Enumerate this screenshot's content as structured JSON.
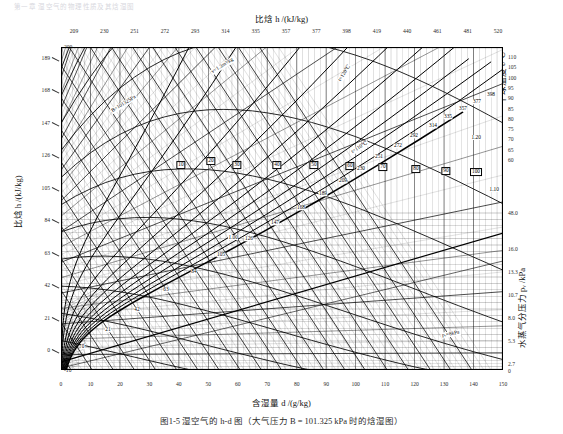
{
  "topnote": "第一章  湿空气的物理性质及其焓湿图",
  "titles": {
    "top": "比焓 h /(kJ/kg)",
    "bottom": "含湿量 d /(g/kg)",
    "left": "比焓 h /(kJ/kg)",
    "right_temp": "干球温度 t/℃",
    "right_pv": "水蒸气分压力 pᵥ /kPa"
  },
  "caption": "图1-5   湿空气的 h-d 图（大气压力 B = 101.325 kPa 时的焓湿图）",
  "axes": {
    "x_label_values": [
      0,
      10,
      20,
      30,
      40,
      50,
      60,
      70,
      80,
      90,
      100,
      110,
      120,
      130,
      140,
      150
    ],
    "x_range": [
      0,
      150
    ],
    "top_enthalpy_ticks": [
      209,
      230,
      251,
      272,
      293,
      314,
      335,
      357,
      377,
      398,
      419,
      440,
      461,
      481,
      520
    ],
    "left_enthalpy_ticks": [
      189,
      168,
      147,
      126,
      105,
      84,
      63,
      42,
      21,
      0
    ],
    "left_temperature_ticks": [
      200,
      190,
      180,
      170,
      160,
      150,
      140,
      130,
      120,
      110,
      100,
      90,
      80,
      70,
      60,
      50,
      40,
      30,
      20,
      10,
      0,
      -10
    ],
    "t_range": [
      -10,
      200
    ],
    "right_temperature_ticks": [
      110,
      105,
      100,
      95,
      90,
      85,
      80,
      75,
      70,
      65,
      60
    ],
    "right_pv_ticks": [
      "48.0",
      "16.0",
      "13.3",
      "10.7",
      "8.0",
      "5.3",
      "2.7",
      "0"
    ]
  },
  "chart_data": {
    "type": "line",
    "xlabel": "含湿量 d /(g/kg)",
    "ylabel": "比焓 h /(kJ/kg)",
    "xlim": [
      0,
      150
    ],
    "ylim": [
      -10,
      200
    ],
    "grid": true,
    "legend": "inline",
    "barometric_pressure_label": "B=101325 Pa",
    "series": [
      {
        "name": "dry-bulb-temperature-isotherms",
        "unit": "℃",
        "values": [
          -10,
          0,
          10,
          20,
          30,
          40,
          50,
          60,
          70,
          80,
          90,
          100,
          110,
          120,
          130,
          140,
          150,
          160,
          170,
          180,
          190,
          200
        ],
        "labels": [
          "t=120℃",
          "t=110℃"
        ]
      },
      {
        "name": "relative-humidity-curves",
        "unit": "%",
        "values": [
          5,
          10,
          20,
          30,
          40,
          50,
          60,
          70,
          80,
          90,
          100
        ],
        "labeled": [
          10,
          20,
          30,
          40,
          50,
          60,
          70,
          80,
          90,
          100
        ]
      },
      {
        "name": "specific-volume-lines",
        "unit": "m³/kg",
        "values": [
          0.8,
          0.85,
          0.9,
          0.95,
          1.0,
          1.05,
          1.1,
          1.15,
          1.2,
          1.25,
          1.3
        ],
        "labels": [
          "v=1.3m³/kg",
          "1.20",
          "1.10",
          "1.00"
        ]
      },
      {
        "name": "enthalpy-isolines",
        "unit": "kJ/kg",
        "values": [
          0,
          21,
          42,
          63,
          84,
          105,
          126,
          147,
          168,
          189,
          209,
          230,
          251,
          272,
          292,
          314,
          335,
          357,
          377,
          398
        ]
      },
      {
        "name": "vapour-pressure-scale",
        "unit": "kPa",
        "values": [
          0,
          2.7,
          5.3,
          8.0,
          10.7,
          13.3,
          16.0,
          48.0
        ],
        "labels": [
          "pᵥ=8kPa"
        ]
      }
    ]
  },
  "inline_labels": {
    "v13": "v=1.3m³/kg",
    "v120": "1.20",
    "v110": "1.10",
    "v100": "1.00",
    "t120": "t=120℃",
    "t110": "t=110℃",
    "barometric": "B=101325Pa",
    "pv8": "pᵥ=8kPa"
  },
  "enthalpy_inline": [
    "0",
    "21",
    "42",
    "63",
    "84",
    "105",
    "126",
    "147",
    "168",
    "189",
    "209",
    "230",
    "251",
    "272",
    "292",
    "314",
    "335",
    "357",
    "377",
    "398"
  ],
  "rh_inline": [
    "10",
    "20",
    "30",
    "40",
    "50",
    "60",
    "70",
    "80",
    "90",
    "100"
  ],
  "colors": {
    "ink": "#000000",
    "grid": "#4a4a4a",
    "frame": "#000000",
    "paper": "#ffffff"
  }
}
